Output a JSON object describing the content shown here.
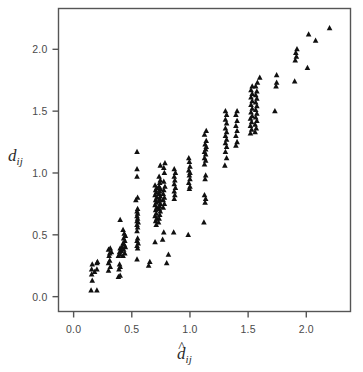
{
  "chart_data": {
    "type": "scatter",
    "title": "",
    "subtitle": "",
    "xlabel": "d-hat_ij",
    "ylabel": "d_ij",
    "xlabel_parts": {
      "base": "d",
      "hat": true,
      "sub": "ij"
    },
    "ylabel_parts": {
      "base": "d",
      "hat": false,
      "sub": "ij"
    },
    "xlim": [
      -0.13,
      2.38
    ],
    "ylim": [
      -0.12,
      2.33
    ],
    "xticks": [
      0.0,
      0.5,
      1.0,
      1.5,
      2.0
    ],
    "yticks": [
      0.0,
      0.5,
      1.0,
      1.5,
      2.0
    ],
    "xticklabels": [
      "0.0",
      "0.5",
      "1.0",
      "1.5",
      "2.0"
    ],
    "yticklabels": [
      "0.0",
      "0.5",
      "1.0",
      "1.5",
      "2.0"
    ],
    "grid": false,
    "legend": null,
    "marker": "triangle-up",
    "marker_color": "#101010",
    "marker_size": 5.6,
    "frame_color": "#555555",
    "background": "#ffffff",
    "series": [
      {
        "name": "Shepard diagram points",
        "points": [
          [
            0.15,
            0.05
          ],
          [
            0.2,
            0.05
          ],
          [
            0.16,
            0.13
          ],
          [
            0.155,
            0.18
          ],
          [
            0.18,
            0.2
          ],
          [
            0.155,
            0.22
          ],
          [
            0.2,
            0.22
          ],
          [
            0.16,
            0.26
          ],
          [
            0.2,
            0.27
          ],
          [
            0.205,
            0.28
          ],
          [
            0.3,
            0.21
          ],
          [
            0.315,
            0.24
          ],
          [
            0.3,
            0.27
          ],
          [
            0.31,
            0.29
          ],
          [
            0.305,
            0.33
          ],
          [
            0.31,
            0.35
          ],
          [
            0.325,
            0.36
          ],
          [
            0.3,
            0.38
          ],
          [
            0.315,
            0.39
          ],
          [
            0.385,
            0.16
          ],
          [
            0.4,
            0.17
          ],
          [
            0.39,
            0.22
          ],
          [
            0.4,
            0.24
          ],
          [
            0.395,
            0.26
          ],
          [
            0.385,
            0.33
          ],
          [
            0.4,
            0.34
          ],
          [
            0.395,
            0.36
          ],
          [
            0.41,
            0.37
          ],
          [
            0.4,
            0.39
          ],
          [
            0.415,
            0.4
          ],
          [
            0.425,
            0.33
          ],
          [
            0.44,
            0.35
          ],
          [
            0.43,
            0.38
          ],
          [
            0.445,
            0.4
          ],
          [
            0.435,
            0.42
          ],
          [
            0.425,
            0.43
          ],
          [
            0.44,
            0.45
          ],
          [
            0.43,
            0.47
          ],
          [
            0.445,
            0.49
          ],
          [
            0.435,
            0.51
          ],
          [
            0.425,
            0.54
          ],
          [
            0.4,
            0.62
          ],
          [
            0.545,
            0.3
          ],
          [
            0.55,
            0.39
          ],
          [
            0.545,
            0.41
          ],
          [
            0.555,
            0.43
          ],
          [
            0.545,
            0.45
          ],
          [
            0.55,
            0.47
          ],
          [
            0.545,
            0.53
          ],
          [
            0.55,
            0.56
          ],
          [
            0.545,
            0.58
          ],
          [
            0.555,
            0.6
          ],
          [
            0.545,
            0.61
          ],
          [
            0.55,
            0.63
          ],
          [
            0.545,
            0.65
          ],
          [
            0.55,
            0.67
          ],
          [
            0.545,
            0.69
          ],
          [
            0.55,
            0.71
          ],
          [
            0.535,
            0.78
          ],
          [
            0.55,
            0.8
          ],
          [
            0.545,
            0.97
          ],
          [
            0.545,
            1.03
          ],
          [
            0.545,
            1.17
          ],
          [
            0.645,
            0.25
          ],
          [
            0.655,
            0.28
          ],
          [
            0.7,
            0.44
          ],
          [
            0.71,
            0.58
          ],
          [
            0.705,
            0.61
          ],
          [
            0.715,
            0.63
          ],
          [
            0.7,
            0.65
          ],
          [
            0.71,
            0.67
          ],
          [
            0.705,
            0.7
          ],
          [
            0.715,
            0.72
          ],
          [
            0.7,
            0.74
          ],
          [
            0.71,
            0.76
          ],
          [
            0.705,
            0.78
          ],
          [
            0.715,
            0.8
          ],
          [
            0.7,
            0.82
          ],
          [
            0.71,
            0.84
          ],
          [
            0.705,
            0.86
          ],
          [
            0.715,
            0.88
          ],
          [
            0.7,
            0.9
          ],
          [
            0.73,
            0.6
          ],
          [
            0.735,
            0.63
          ],
          [
            0.74,
            0.66
          ],
          [
            0.745,
            0.69
          ],
          [
            0.735,
            0.71
          ],
          [
            0.74,
            0.73
          ],
          [
            0.745,
            0.75
          ],
          [
            0.735,
            0.77
          ],
          [
            0.74,
            0.79
          ],
          [
            0.745,
            0.81
          ],
          [
            0.735,
            0.83
          ],
          [
            0.74,
            0.85
          ],
          [
            0.745,
            0.87
          ],
          [
            0.735,
            0.89
          ],
          [
            0.74,
            0.92
          ],
          [
            0.745,
            0.94
          ],
          [
            0.735,
            0.97
          ],
          [
            0.745,
            1.06
          ],
          [
            0.765,
            0.46
          ],
          [
            0.775,
            0.52
          ],
          [
            0.77,
            0.72
          ],
          [
            0.78,
            0.75
          ],
          [
            0.77,
            0.78
          ],
          [
            0.78,
            0.8
          ],
          [
            0.77,
            0.83
          ],
          [
            0.775,
            0.86
          ],
          [
            0.785,
            0.89
          ],
          [
            0.775,
            0.93
          ],
          [
            0.78,
            1.0
          ],
          [
            0.775,
            1.04
          ],
          [
            0.785,
            1.08
          ],
          [
            0.8,
            0.27
          ],
          [
            0.815,
            0.34
          ],
          [
            0.86,
            0.52
          ],
          [
            0.865,
            0.79
          ],
          [
            0.87,
            0.82
          ],
          [
            0.865,
            0.85
          ],
          [
            0.875,
            0.88
          ],
          [
            0.865,
            0.91
          ],
          [
            0.87,
            0.94
          ],
          [
            0.865,
            0.97
          ],
          [
            0.875,
            1.0
          ],
          [
            0.865,
            1.03
          ],
          [
            0.985,
            0.5
          ],
          [
            0.995,
            0.87
          ],
          [
            1.0,
            0.89
          ],
          [
            0.99,
            0.92
          ],
          [
            1.0,
            0.95
          ],
          [
            0.995,
            0.98
          ],
          [
            1.0,
            1.0
          ],
          [
            0.99,
            1.02
          ],
          [
            1.0,
            1.05
          ],
          [
            0.995,
            1.09
          ],
          [
            0.99,
            1.12
          ],
          [
            1.12,
            0.6
          ],
          [
            1.13,
            0.76
          ],
          [
            1.135,
            0.79
          ],
          [
            1.125,
            0.82
          ],
          [
            1.13,
            0.95
          ],
          [
            1.135,
            0.98
          ],
          [
            1.125,
            1.07
          ],
          [
            1.135,
            1.1
          ],
          [
            1.125,
            1.12
          ],
          [
            1.135,
            1.15
          ],
          [
            1.125,
            1.17
          ],
          [
            1.135,
            1.19
          ],
          [
            1.14,
            1.21
          ],
          [
            1.13,
            1.23
          ],
          [
            1.14,
            1.26
          ],
          [
            1.125,
            1.31
          ],
          [
            1.14,
            1.34
          ],
          [
            1.3,
            1.06
          ],
          [
            1.315,
            1.12
          ],
          [
            1.305,
            1.17
          ],
          [
            1.315,
            1.21
          ],
          [
            1.305,
            1.24
          ],
          [
            1.315,
            1.27
          ],
          [
            1.305,
            1.3
          ],
          [
            1.315,
            1.33
          ],
          [
            1.305,
            1.36
          ],
          [
            1.315,
            1.4
          ],
          [
            1.305,
            1.43
          ],
          [
            1.315,
            1.47
          ],
          [
            1.305,
            1.5
          ],
          [
            1.395,
            1.22
          ],
          [
            1.405,
            1.25
          ],
          [
            1.395,
            1.3
          ],
          [
            1.405,
            1.34
          ],
          [
            1.395,
            1.38
          ],
          [
            1.405,
            1.42
          ],
          [
            1.395,
            1.47
          ],
          [
            1.405,
            1.5
          ],
          [
            1.52,
            1.32
          ],
          [
            1.53,
            1.35
          ],
          [
            1.52,
            1.38
          ],
          [
            1.53,
            1.41
          ],
          [
            1.52,
            1.44
          ],
          [
            1.535,
            1.46
          ],
          [
            1.525,
            1.49
          ],
          [
            1.535,
            1.52
          ],
          [
            1.525,
            1.55
          ],
          [
            1.535,
            1.58
          ],
          [
            1.525,
            1.61
          ],
          [
            1.535,
            1.64
          ],
          [
            1.525,
            1.67
          ],
          [
            1.535,
            1.7
          ],
          [
            1.56,
            1.33
          ],
          [
            1.57,
            1.36
          ],
          [
            1.56,
            1.39
          ],
          [
            1.575,
            1.42
          ],
          [
            1.565,
            1.45
          ],
          [
            1.575,
            1.48
          ],
          [
            1.565,
            1.51
          ],
          [
            1.575,
            1.54
          ],
          [
            1.565,
            1.57
          ],
          [
            1.575,
            1.6
          ],
          [
            1.565,
            1.63
          ],
          [
            1.575,
            1.66
          ],
          [
            1.565,
            1.7
          ],
          [
            1.58,
            1.73
          ],
          [
            1.6,
            1.77
          ],
          [
            1.73,
            1.5
          ],
          [
            1.74,
            1.7
          ],
          [
            1.745,
            1.73
          ],
          [
            1.745,
            1.79
          ],
          [
            1.9,
            1.74
          ],
          [
            1.905,
            1.91
          ],
          [
            1.915,
            1.94
          ],
          [
            1.91,
            1.97
          ],
          [
            1.92,
            2.0
          ],
          [
            2.01,
            1.85
          ],
          [
            2.02,
            2.12
          ],
          [
            2.08,
            2.07
          ],
          [
            2.2,
            2.17
          ]
        ]
      }
    ]
  },
  "axes": {
    "x_title": "d̂",
    "y_title": "d",
    "subscript": "ij"
  }
}
